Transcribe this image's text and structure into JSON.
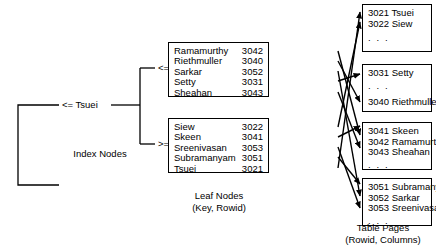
{
  "diagram": {
    "title_hidden": "B+ tree index over table pages",
    "index": {
      "root_label": "<= Tsuei",
      "branch_labels": [
        "<= Sheahan",
        ">= Siew"
      ],
      "caption": "Index Nodes"
    },
    "leaf_nodes": {
      "caption_line1": "Leaf Nodes",
      "caption_line2": "(Key, Rowid)",
      "boxes": [
        {
          "entries": [
            {
              "key": "Ramamurthy",
              "rowid": "3042"
            },
            {
              "key": "Riethmuller",
              "rowid": "3040"
            },
            {
              "key": "Sarkar",
              "rowid": "3052"
            },
            {
              "key": "Setty",
              "rowid": "3031"
            },
            {
              "key": "Sheahan",
              "rowid": "3043"
            }
          ]
        },
        {
          "entries": [
            {
              "key": "Siew",
              "rowid": "3022"
            },
            {
              "key": "Skeen",
              "rowid": "3041"
            },
            {
              "key": "Sreenivasan",
              "rowid": "3053"
            },
            {
              "key": "Subramanyam",
              "rowid": "3051"
            },
            {
              "key": "Tsuei",
              "rowid": "3021"
            }
          ]
        }
      ]
    },
    "table_pages": {
      "caption_line1": "Table Pages",
      "caption_line2": "(Rowid, Columns)",
      "ellipsis": ". . .",
      "pages": [
        {
          "rows": [
            "3021 Tsuei",
            "3022 Siew"
          ],
          "ellipsis_position": "bottom"
        },
        {
          "rows": [
            "3031 Setty",
            "3040 Riethmuller"
          ],
          "ellipsis_position": "middle"
        },
        {
          "rows": [
            "3041 Skeen",
            "3042 Ramamurthy",
            "3043 Sheahan"
          ],
          "ellipsis_position": "bottom"
        },
        {
          "rows": [
            "3051 Subramanyam",
            "3052 Sarkar",
            "3053 Sreenivasan"
          ],
          "ellipsis_position": "bottom"
        }
      ]
    },
    "colors": {
      "line": "#000000",
      "background": "#ffffff",
      "text": "#000000"
    }
  }
}
